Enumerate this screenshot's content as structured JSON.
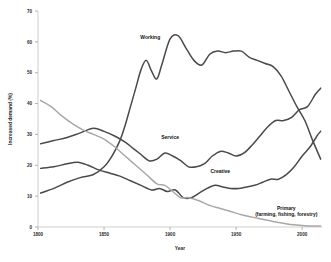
{
  "chart_data": {
    "type": "line",
    "title": "",
    "xlabel": "Year",
    "ylabel": "Increased demand (%)",
    "xlim": [
      1800,
      2015
    ],
    "ylim": [
      0,
      70
    ],
    "grid": false,
    "legend_position": "inline-labels",
    "y_ticks": [
      "0",
      "10",
      "20",
      "30",
      "40",
      "50",
      "60",
      "70"
    ],
    "y_tick_values": [
      0,
      10,
      20,
      30,
      40,
      50,
      60,
      70
    ],
    "x_ticks": [
      "1800",
      "1850",
      "1900",
      "1950",
      "2000"
    ],
    "x_tick_values": [
      1800,
      1850,
      1900,
      1950,
      2000
    ],
    "series": [
      {
        "name": "Working",
        "color": "#4a4a4a",
        "label_x": 1885,
        "label_y": 61,
        "x": [
          1802,
          1812,
          1822,
          1832,
          1842,
          1850,
          1856,
          1862,
          1866,
          1870,
          1874,
          1878,
          1882,
          1886,
          1890,
          1894,
          1900,
          1906,
          1912,
          1918,
          1924,
          1930,
          1936,
          1942,
          1948,
          1954,
          1960,
          1966,
          1972,
          1978,
          1984,
          1990,
          1996,
          2002,
          2008,
          2014
        ],
        "values": [
          11,
          12.5,
          14.5,
          16,
          17,
          19.5,
          23,
          28,
          33,
          39,
          45,
          51,
          54,
          50.5,
          48,
          53,
          61,
          62,
          58,
          54,
          52.5,
          56,
          57,
          56.5,
          57,
          57,
          55,
          54,
          53,
          52,
          49,
          44,
          39,
          34.5,
          28,
          22
        ]
      },
      {
        "name": "Service",
        "color": "#4a4a4a",
        "label_x": 1900,
        "label_y": 28.5,
        "x": [
          1802,
          1812,
          1822,
          1832,
          1842,
          1850,
          1858,
          1866,
          1872,
          1878,
          1884,
          1890,
          1896,
          1902,
          1908,
          1914,
          1920,
          1926,
          1932,
          1938,
          1944,
          1950,
          1956,
          1962,
          1968,
          1974,
          1980,
          1986,
          1992,
          1998,
          2004,
          2010,
          2014
        ],
        "values": [
          27,
          28,
          29,
          30.5,
          32,
          31,
          29.5,
          27.5,
          25.5,
          23.5,
          21.5,
          22,
          24,
          23,
          21.5,
          19.5,
          19.5,
          20.5,
          23,
          24.5,
          24,
          23,
          24,
          26.5,
          29.5,
          32.5,
          34.5,
          34.5,
          35.5,
          38,
          39,
          43,
          45
        ]
      },
      {
        "name": "Creative",
        "color": "#4a4a4a",
        "label_x": 1938,
        "label_y": 17.5,
        "x": [
          1802,
          1812,
          1822,
          1830,
          1838,
          1846,
          1854,
          1862,
          1870,
          1878,
          1886,
          1892,
          1898,
          1904,
          1910,
          1916,
          1922,
          1928,
          1934,
          1940,
          1946,
          1952,
          1958,
          1964,
          1970,
          1976,
          1982,
          1988,
          1994,
          2000,
          2006,
          2012,
          2014
        ],
        "values": [
          19,
          19.5,
          20.5,
          21,
          20,
          18.5,
          17.5,
          16.5,
          15,
          13.5,
          12,
          12.5,
          11.5,
          12,
          9.5,
          9.5,
          11,
          12.5,
          13.5,
          13,
          12.5,
          12.5,
          13,
          13.5,
          14.5,
          15.5,
          15.5,
          17,
          19.5,
          23,
          26,
          30,
          31
        ]
      },
      {
        "name": "Primary (farming, fishing, forestry)",
        "color": "#a8a8a8",
        "label_x": 1988,
        "label_y": 5.5,
        "x": [
          1802,
          1810,
          1818,
          1826,
          1834,
          1842,
          1850,
          1858,
          1866,
          1874,
          1882,
          1890,
          1896,
          1902,
          1908,
          1914,
          1922,
          1930,
          1938,
          1946,
          1954,
          1962,
          1970,
          1978,
          1986,
          1994,
          2002,
          2010,
          2014
        ],
        "values": [
          41,
          39,
          36,
          33.5,
          31.5,
          30,
          28.5,
          26,
          23,
          20,
          17,
          14,
          13.5,
          11.5,
          9.5,
          9.5,
          8.5,
          7,
          6,
          5,
          4,
          3.2,
          2.5,
          1.8,
          1.2,
          0.7,
          0.4,
          0.3,
          0.3
        ]
      }
    ],
    "series_label_lines": {
      "primary_line1": "Primary",
      "primary_line2": "(farming, fishing, forestry)"
    }
  }
}
